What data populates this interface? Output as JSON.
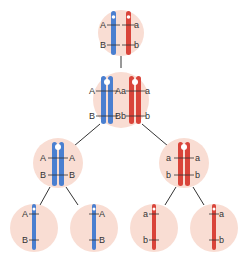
{
  "colors": {
    "cell_fill": "#f9ddd3",
    "maternal": "#4a7fd0",
    "paternal": "#d9443a",
    "line": "#333333",
    "label": "#333333"
  },
  "cells": {
    "parent": {
      "labels": {
        "left_top": "A",
        "left_bottom": "B",
        "right_top": "a",
        "right_bottom": "b"
      }
    },
    "replicated": {
      "labels": {
        "l1": "A",
        "l2": "Aa",
        "l3": "a",
        "b1": "B",
        "b2": "Bb",
        "b3": "b"
      }
    },
    "meiosis1_left": {
      "labels": {
        "tl": "A",
        "tr": "A",
        "bl": "B",
        "br": "B"
      }
    },
    "meiosis1_right": {
      "labels": {
        "tl": "a",
        "tr": "a",
        "bl": "b",
        "br": "b"
      }
    },
    "gamete1": {
      "labels": {
        "top": "A",
        "bottom": "B"
      }
    },
    "gamete2": {
      "labels": {
        "top": "A",
        "bottom": "B"
      }
    },
    "gamete3": {
      "labels": {
        "top": "a",
        "bottom": "b"
      }
    },
    "gamete4": {
      "labels": {
        "top": "a",
        "bottom": "b"
      }
    }
  }
}
